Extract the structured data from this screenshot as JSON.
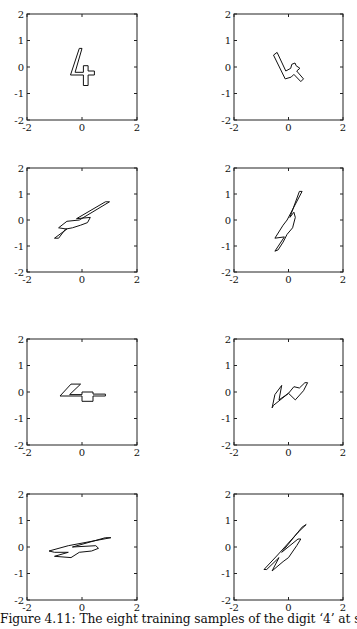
{
  "caption": "Figure 4.11: The eight training samples of the digit ‘4’ at scale 1.",
  "chart_data": [
    {
      "type": "line",
      "title": "Sample 1",
      "xlim": [
        -2,
        2
      ],
      "ylim": [
        -2,
        2
      ],
      "xticks": [
        "-2",
        "0",
        "2"
      ],
      "yticks": [
        "2",
        "1",
        "0",
        "-1",
        "-2"
      ],
      "grid": false,
      "outline": [
        [
          -0.1,
          0.7
        ],
        [
          0.0,
          0.7
        ],
        [
          -0.25,
          -0.2
        ],
        [
          0.05,
          -0.2
        ],
        [
          0.05,
          0.05
        ],
        [
          0.22,
          0.05
        ],
        [
          0.22,
          -0.15
        ],
        [
          0.45,
          -0.15
        ],
        [
          0.45,
          -0.3
        ],
        [
          0.22,
          -0.3
        ],
        [
          0.22,
          -0.7
        ],
        [
          0.05,
          -0.7
        ],
        [
          0.05,
          -0.3
        ],
        [
          -0.42,
          -0.3
        ]
      ]
    },
    {
      "type": "line",
      "title": "Sample 2",
      "xlim": [
        -2,
        2
      ],
      "ylim": [
        -2,
        2
      ],
      "xticks": [
        "-2",
        "0",
        "2"
      ],
      "yticks": [
        "2",
        "1",
        "0",
        "-1",
        "-2"
      ],
      "grid": false,
      "outline": [
        [
          -0.55,
          0.45
        ],
        [
          -0.42,
          0.55
        ],
        [
          -0.1,
          -0.15
        ],
        [
          0.08,
          -0.05
        ],
        [
          0.12,
          0.1
        ],
        [
          0.24,
          0.15
        ],
        [
          0.28,
          0.05
        ],
        [
          0.42,
          -0.05
        ],
        [
          0.3,
          -0.15
        ],
        [
          0.55,
          -0.45
        ],
        [
          0.45,
          -0.55
        ],
        [
          0.2,
          -0.28
        ],
        [
          0.1,
          -0.38
        ],
        [
          -0.12,
          -0.45
        ]
      ]
    },
    {
      "type": "line",
      "title": "Sample 3",
      "xlim": [
        -2,
        2
      ],
      "ylim": [
        -2,
        2
      ],
      "xticks": [
        "-2",
        "0",
        "2"
      ],
      "yticks": [
        "2",
        "1",
        "0",
        "-1",
        "-2"
      ],
      "grid": false,
      "outline": [
        [
          -1.0,
          -0.7
        ],
        [
          -0.55,
          -0.35
        ],
        [
          -0.85,
          -0.3
        ],
        [
          -0.55,
          -0.05
        ],
        [
          -0.1,
          0.0
        ],
        [
          1.0,
          0.7
        ],
        [
          0.85,
          0.7
        ],
        [
          -0.2,
          0.05
        ],
        [
          0.3,
          0.1
        ],
        [
          0.2,
          -0.1
        ],
        [
          -0.05,
          -0.2
        ],
        [
          -0.35,
          -0.3
        ],
        [
          -0.6,
          -0.35
        ],
        [
          -0.85,
          -0.7
        ]
      ]
    },
    {
      "type": "line",
      "title": "Sample 4",
      "xlim": [
        -2,
        2
      ],
      "ylim": [
        -2,
        2
      ],
      "xticks": [
        "-2",
        "0",
        "2"
      ],
      "yticks": [
        "2",
        "1",
        "0",
        "-1",
        "-2"
      ],
      "grid": false,
      "outline": [
        [
          -0.5,
          -1.2
        ],
        [
          -0.15,
          -0.65
        ],
        [
          -0.5,
          -0.7
        ],
        [
          -0.2,
          -0.2
        ],
        [
          -0.05,
          0.0
        ],
        [
          0.5,
          1.1
        ],
        [
          0.4,
          1.1
        ],
        [
          0.05,
          0.1
        ],
        [
          0.2,
          0.3
        ],
        [
          0.25,
          0.1
        ],
        [
          0.15,
          -0.3
        ],
        [
          -0.05,
          -0.55
        ],
        [
          -0.2,
          -0.85
        ],
        [
          -0.38,
          -1.15
        ]
      ]
    },
    {
      "type": "line",
      "title": "Sample 5",
      "xlim": [
        -2,
        2
      ],
      "ylim": [
        -2,
        2
      ],
      "xticks": [
        "-2",
        "0",
        "2"
      ],
      "yticks": [
        "2",
        "1",
        "0",
        "-1",
        "-2"
      ],
      "grid": false,
      "outline": [
        [
          -0.8,
          -0.15
        ],
        [
          -0.4,
          0.3
        ],
        [
          -0.05,
          0.3
        ],
        [
          -0.45,
          -0.1
        ],
        [
          0.0,
          -0.1
        ],
        [
          0.0,
          0.0
        ],
        [
          0.4,
          0.0
        ],
        [
          0.4,
          -0.08
        ],
        [
          0.85,
          -0.08
        ],
        [
          0.85,
          -0.15
        ],
        [
          0.4,
          -0.15
        ],
        [
          0.4,
          -0.35
        ],
        [
          0.0,
          -0.35
        ],
        [
          0.0,
          -0.15
        ]
      ]
    },
    {
      "type": "line",
      "title": "Sample 6",
      "xlim": [
        -2,
        2
      ],
      "ylim": [
        -2,
        2
      ],
      "xticks": [
        "-2",
        "0",
        "2"
      ],
      "yticks": [
        "2",
        "1",
        "0",
        "-1",
        "-2"
      ],
      "grid": false,
      "outline": [
        [
          -0.6,
          -0.6
        ],
        [
          -0.5,
          -0.1
        ],
        [
          -0.25,
          0.25
        ],
        [
          -0.35,
          -0.3
        ],
        [
          0.0,
          -0.05
        ],
        [
          0.25,
          -0.3
        ],
        [
          0.55,
          0.05
        ],
        [
          0.7,
          0.35
        ],
        [
          0.6,
          0.35
        ],
        [
          0.4,
          0.15
        ],
        [
          0.2,
          0.2
        ],
        [
          0.0,
          -0.05
        ],
        [
          -0.55,
          -0.5
        ]
      ]
    },
    {
      "type": "line",
      "title": "Sample 7",
      "xlim": [
        -2,
        2
      ],
      "ylim": [
        -2,
        2
      ],
      "xticks": [
        "-2",
        "0",
        "2"
      ],
      "yticks": [
        "2",
        "1",
        "0",
        "-1",
        "-2"
      ],
      "grid": false,
      "outline": [
        [
          -1.2,
          -0.15
        ],
        [
          -0.5,
          0.05
        ],
        [
          1.05,
          0.35
        ],
        [
          0.85,
          0.35
        ],
        [
          -0.35,
          0.0
        ],
        [
          0.5,
          0.05
        ],
        [
          0.6,
          -0.05
        ],
        [
          0.35,
          -0.15
        ],
        [
          -0.1,
          -0.2
        ],
        [
          -0.4,
          -0.4
        ],
        [
          -1.0,
          -0.35
        ],
        [
          -0.5,
          -0.2
        ],
        [
          -1.0,
          -0.2
        ]
      ]
    },
    {
      "type": "line",
      "title": "Sample 8",
      "xlim": [
        -2,
        2
      ],
      "ylim": [
        -2,
        2
      ],
      "xticks": [
        "-2",
        "0",
        "2"
      ],
      "yticks": [
        "2",
        "1",
        "0",
        "-1",
        "-2"
      ],
      "grid": false,
      "outline": [
        [
          -0.9,
          -0.85
        ],
        [
          -0.4,
          -0.3
        ],
        [
          0.35,
          0.55
        ],
        [
          0.65,
          0.85
        ],
        [
          0.5,
          0.75
        ],
        [
          -0.25,
          -0.2
        ],
        [
          0.35,
          0.3
        ],
        [
          0.45,
          0.3
        ],
        [
          0.3,
          0.05
        ],
        [
          0.0,
          -0.4
        ],
        [
          -0.2,
          -0.55
        ],
        [
          -0.6,
          -0.9
        ],
        [
          -0.35,
          -0.4
        ],
        [
          -0.8,
          -0.85
        ]
      ]
    }
  ]
}
